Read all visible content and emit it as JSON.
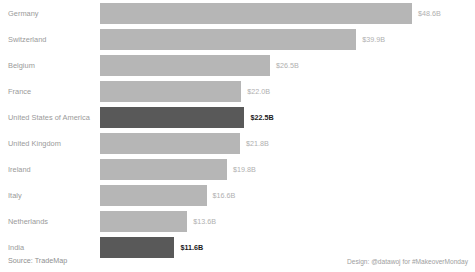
{
  "chart_data": {
    "type": "bar",
    "orientation": "horizontal",
    "title": "",
    "subtitle": "",
    "xlabel": "",
    "ylabel": "",
    "grid": false,
    "legend": false,
    "xlim": [
      0,
      48.6
    ],
    "value_prefix": "$",
    "value_suffix": "B",
    "categories": [
      "Germany",
      "Switzerland",
      "Belgium",
      "France",
      "United States of America",
      "United Kingdom",
      "Ireland",
      "Italy",
      "Netherlands",
      "India"
    ],
    "values": [
      48.6,
      39.9,
      26.5,
      22.0,
      22.5,
      21.8,
      19.8,
      16.6,
      13.6,
      11.6
    ],
    "data_labels": [
      "$48.6B",
      "$39.9B",
      "$26.5B",
      "$22.0B",
      "$22.5B",
      "$21.8B",
      "$19.8B",
      "$16.6B",
      "$13.6B",
      "$11.6B"
    ],
    "highlighted": [
      false,
      false,
      false,
      false,
      true,
      false,
      false,
      false,
      false,
      true
    ],
    "colors": {
      "bar_default": "#b6b6b6",
      "bar_highlight": "#595959",
      "label_default": "#b0b0b0",
      "label_highlight": "#1a1a1a",
      "category_text": "#9a9a9a",
      "background": "#ffffff"
    }
  },
  "footer": {
    "source": "Source: TradeMap",
    "credit": "Design: @datawoj for #MakeoverMonday"
  }
}
